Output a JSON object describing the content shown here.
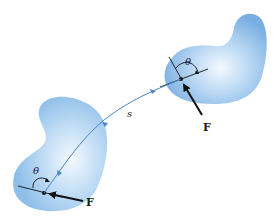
{
  "diagram": {
    "colors": {
      "blob_fill": "#8fbfe8",
      "blob_highlight": "#eef6fd",
      "path": "#4a86c8",
      "force": "#111111"
    },
    "path": {
      "label": "s"
    },
    "lower_body": {
      "angle_label": "θ",
      "force_label": "F"
    },
    "upper_body": {
      "angle_label": "θ",
      "force_label": "F"
    }
  }
}
